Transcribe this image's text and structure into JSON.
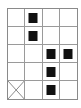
{
  "grid": {
    "columns": 4,
    "rows": 5,
    "line_color": "#9a9a9a",
    "block_color": "#111111",
    "filled_cells": [
      {
        "row": 0,
        "col": 1
      },
      {
        "row": 1,
        "col": 1
      },
      {
        "row": 2,
        "col": 2
      },
      {
        "row": 2,
        "col": 3
      },
      {
        "row": 3,
        "col": 2
      },
      {
        "row": 4,
        "col": 2
      }
    ],
    "crossed_cells": [
      {
        "row": 4,
        "col": 0
      }
    ]
  }
}
